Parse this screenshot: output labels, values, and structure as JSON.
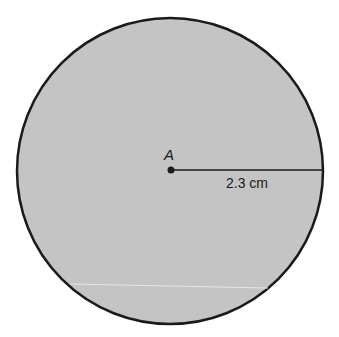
{
  "diagram": {
    "shape": "circle",
    "fill_color": "#c4c4c4",
    "stroke_color": "#1a1a1a",
    "center_label": "A",
    "radius_label": "2.3 cm",
    "radius_value": 2.3,
    "radius_unit": "cm"
  }
}
